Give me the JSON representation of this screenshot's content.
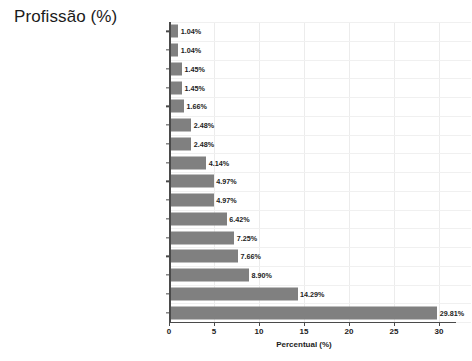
{
  "chart_data": {
    "type": "bar",
    "orientation": "horizontal",
    "title": "Profissão (%)",
    "xlabel": "Percentual (%)",
    "ylabel": "",
    "xlim": [
      0,
      31
    ],
    "xticks": [
      0,
      5,
      10,
      15,
      20,
      25,
      30
    ],
    "xtick_labels": [
      "0",
      "5",
      "10",
      "15",
      "20",
      "25",
      "30"
    ],
    "grid": true,
    "legend": null,
    "bar_color": "#808080",
    "categories": [
      "Economista",
      "Engenheiro",
      "Comerciante",
      "Funcionária Público/Funcionário Público",
      "Advogado",
      "Bancária/Bancário",
      "Político",
      "Jornalista",
      "Professora/Professor",
      "Sindicalista",
      "Militar",
      "Trabalhador rural",
      "Não consta",
      "Operária/Operário",
      "Outros",
      "Estudante"
    ],
    "values": [
      1.04,
      1.04,
      1.45,
      1.45,
      1.66,
      2.48,
      2.48,
      4.14,
      4.97,
      4.97,
      6.42,
      7.25,
      7.66,
      8.9,
      14.29,
      29.81
    ],
    "data_labels": [
      "1.04%",
      "1.04%",
      "1.45%",
      "1.45%",
      "1.66%",
      "2.48%",
      "2.48%",
      "4.14%",
      "4.97%",
      "4.97%",
      "6.42%",
      "7.25%",
      "7.66%",
      "8.90%",
      "14.29%",
      "29.81%"
    ]
  }
}
